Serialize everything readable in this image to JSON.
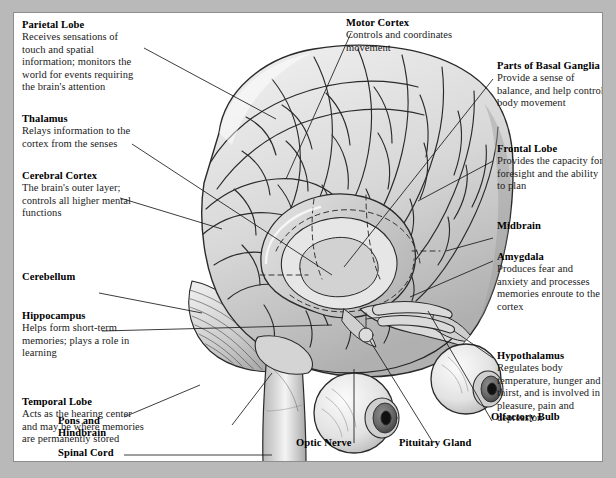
{
  "figure": {
    "style": "grayscale pen-and-ink illustration with leader-line callouts",
    "frame_color": "#8d8d8d",
    "page_background": "#b9b9b9",
    "panel_background": "#ffffff"
  },
  "labels": {
    "parietal_lobe": {
      "title": "Parietal Lobe",
      "description": "Receives sensations of touch and spatial information; monitors the world for events requiring the brain's attention"
    },
    "thalamus": {
      "title": "Thalamus",
      "description": "Relays information to the cortex from the senses"
    },
    "cerebral_cortex": {
      "title": "Cerebral Cortex",
      "description": "The brain's outer layer; controls all higher mental functions"
    },
    "cerebellum": {
      "title": "Cerebellum",
      "description": ""
    },
    "hippocampus": {
      "title": "Hippocampus",
      "description": "Helps form short-term memories; plays a role in learning"
    },
    "temporal_lobe": {
      "title": "Temporal Lobe",
      "description": "Acts as the hearing center and may be where memories are permanently stored"
    },
    "motor_cortex": {
      "title": "Motor Cortex",
      "description": "Controls and coordinates movement"
    },
    "basal_ganglia": {
      "title": "Parts of Basal Ganglia",
      "description": "Provide a sense of balance, and help control body movement"
    },
    "frontal_lobe": {
      "title": "Frontal Lobe",
      "description": "Provides the capacity for foresight and the ability to plan"
    },
    "midbrain": {
      "title": "Midbrain",
      "description": ""
    },
    "amygdala": {
      "title": "Amygdala",
      "description": "Produces fear and anxiety and processes memories enroute to the cortex"
    },
    "hypothalamus": {
      "title": "Hypothalamus",
      "description": "Regulates body temperature, hunger and thirst, and is involved in pleasure, pain and depression"
    },
    "pons_hindbrain": {
      "title": "Pons and Hindbrain",
      "description": ""
    },
    "spinal_cord": {
      "title": "Spinal Cord",
      "description": ""
    },
    "optic_nerve": {
      "title": "Optic Nerve",
      "description": ""
    },
    "pituitary_gland": {
      "title": "Pituitary Gland",
      "description": ""
    },
    "olfactory_bulb": {
      "title": "Olfactory Bulb",
      "description": ""
    }
  }
}
